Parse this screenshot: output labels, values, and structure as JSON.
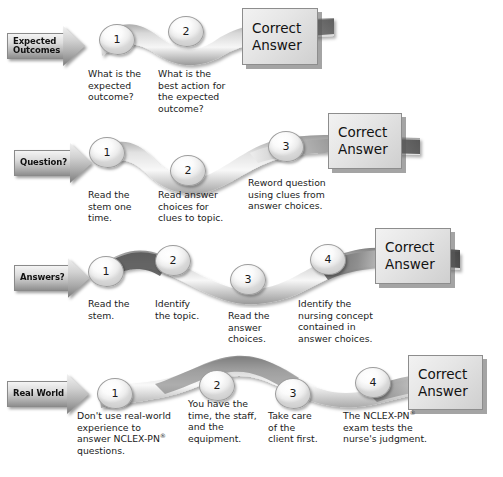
{
  "diagram": {
    "background_color": "#ffffff",
    "answer_box_label_line1": "Correct",
    "answer_box_label_line2": "Answer",
    "rows": [
      {
        "id": "expected-outcomes",
        "arrow_label": "Expected\nOutcomes",
        "steps": [
          {
            "number": "1",
            "caption": "What is the\nexpected\noutcome?"
          },
          {
            "number": "2",
            "caption": "What is the\nbest action for\nthe expected\noutcome?"
          }
        ]
      },
      {
        "id": "question",
        "arrow_label": "Question?",
        "steps": [
          {
            "number": "1",
            "caption": "Read the\nstem one\ntime."
          },
          {
            "number": "2",
            "caption": "Read answer\nchoices for\nclues to topic."
          },
          {
            "number": "3",
            "caption": "Reword question\nusing clues from\nanswer choices."
          }
        ]
      },
      {
        "id": "answers",
        "arrow_label": "Answers?",
        "steps": [
          {
            "number": "1",
            "caption": "Read the\nstem."
          },
          {
            "number": "2",
            "caption": "Identify\nthe topic."
          },
          {
            "number": "3",
            "caption": "Read the\nanswer\nchoices."
          },
          {
            "number": "4",
            "caption": "Identify the\nnursing concept\ncontained in\nanswer choices."
          }
        ]
      },
      {
        "id": "real-world",
        "arrow_label": "Real World",
        "steps": [
          {
            "number": "1",
            "caption": "Don't use real-world\nexperience to\nanswer NCLEX-PN®\nquestions."
          },
          {
            "number": "2",
            "caption": "You have the\ntime, the staff,\nand the\nequipment."
          },
          {
            "number": "3",
            "caption": "Take care\nof the\nclient first."
          },
          {
            "number": "4",
            "caption": "The NCLEX-PN®\nexam tests the\nnurse's judgment."
          }
        ]
      }
    ],
    "colors": {
      "ribbon_light": "#fbfbfb",
      "ribbon_mid": "#b9b9b9",
      "ribbon_dark": "#4c4c4c",
      "bubble_fill": "#fcfcfc",
      "bubble_stroke": "#9c9c9c",
      "answer_box_fill": "#e6e6e6",
      "answer_box_shadow": "#5a5a5a",
      "text": "#1b1b1b"
    }
  }
}
